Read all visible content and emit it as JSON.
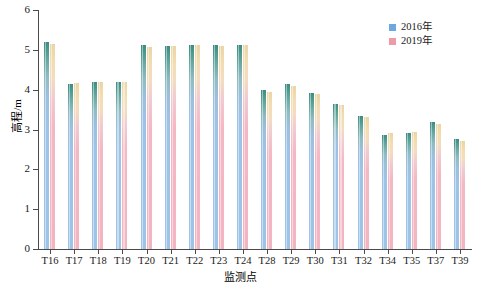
{
  "chart_data": {
    "type": "bar",
    "title": "",
    "xlabel": "监测点",
    "ylabel": "高程/m",
    "ylim": [
      0,
      6
    ],
    "yticks": [
      0,
      1,
      2,
      3,
      4,
      5,
      6
    ],
    "grid": false,
    "legend_position": "top-right",
    "categories": [
      "T16",
      "T17",
      "T18",
      "T19",
      "T20",
      "T21",
      "T22",
      "T23",
      "T24",
      "T28",
      "T29",
      "T30",
      "T31",
      "T32",
      "T34",
      "T35",
      "T37",
      "T39"
    ],
    "series": [
      {
        "name": "2016年",
        "color": "#9dc3e6",
        "values": [
          5.2,
          4.15,
          4.2,
          4.2,
          5.12,
          5.1,
          5.12,
          5.12,
          5.12,
          4.0,
          4.15,
          3.92,
          3.65,
          3.35,
          2.85,
          2.9,
          3.2,
          2.75
        ]
      },
      {
        "name": "2019年",
        "color": "#f2b4c1",
        "values": [
          5.15,
          4.17,
          4.2,
          4.2,
          5.08,
          5.1,
          5.12,
          5.1,
          5.12,
          3.95,
          4.1,
          3.88,
          3.62,
          3.32,
          2.9,
          2.95,
          3.15,
          2.72
        ]
      }
    ]
  },
  "legend": {
    "items": [
      {
        "label": "2016年",
        "color": "#9dc3e6"
      },
      {
        "label": "2019年",
        "color": "#f2b4c1"
      }
    ]
  },
  "axes": {
    "y_title": "高程/m",
    "x_title": "监测点",
    "y_ticks": [
      "0",
      "1",
      "2",
      "3",
      "4",
      "5",
      "6"
    ]
  }
}
